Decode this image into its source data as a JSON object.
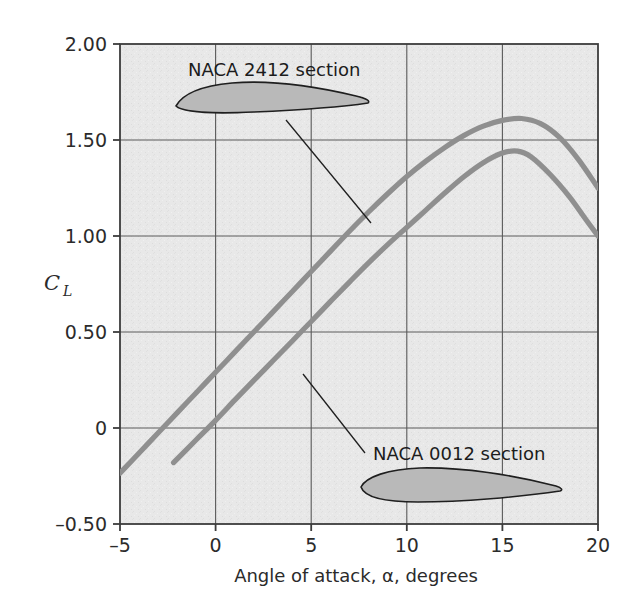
{
  "chart_data": {
    "type": "line",
    "title": "",
    "xlabel": "Angle of attack, α, degrees",
    "ylabel": "C_L",
    "xlim": [
      -5,
      20
    ],
    "ylim": [
      -0.5,
      2.0
    ],
    "xticks": [
      -5,
      0,
      5,
      10,
      15,
      20
    ],
    "xticklabels": [
      "–5",
      "0",
      "5",
      "10",
      "15",
      "20"
    ],
    "yticks": [
      -0.5,
      0,
      0.5,
      1.0,
      1.5,
      2.0
    ],
    "yticklabels": [
      "–0.50",
      "0",
      "0.50",
      "1.00",
      "1.50",
      "2.00"
    ],
    "grid": true,
    "grid_x": [
      0,
      5,
      10,
      15
    ],
    "grid_y": [
      0,
      0.5,
      1.0,
      1.5
    ],
    "legend": "none",
    "plot_bg": "#e6e6e6",
    "curve_color": "#8f8f8f",
    "axis_color": "#4a4a4a",
    "series": [
      {
        "name": "NACA 2412 section",
        "points": [
          [
            -5.0,
            -0.235
          ],
          [
            -4.0,
            -0.13
          ],
          [
            -3.0,
            -0.025
          ],
          [
            -2.0,
            0.08
          ],
          [
            -1.0,
            0.185
          ],
          [
            0.0,
            0.29
          ],
          [
            1.0,
            0.395
          ],
          [
            2.0,
            0.5
          ],
          [
            3.0,
            0.605
          ],
          [
            4.0,
            0.71
          ],
          [
            5.0,
            0.815
          ],
          [
            6.0,
            0.92
          ],
          [
            7.0,
            1.025
          ],
          [
            8.0,
            1.125
          ],
          [
            9.0,
            1.22
          ],
          [
            10.0,
            1.31
          ],
          [
            11.0,
            1.39
          ],
          [
            12.0,
            1.462
          ],
          [
            13.0,
            1.524
          ],
          [
            14.0,
            1.572
          ],
          [
            15.0,
            1.602
          ],
          [
            16.0,
            1.612
          ],
          [
            17.0,
            1.585
          ],
          [
            18.0,
            1.512
          ],
          [
            19.0,
            1.395
          ],
          [
            20.0,
            1.25
          ]
        ]
      },
      {
        "name": "NACA 0012 section",
        "points": [
          [
            -2.2,
            -0.18
          ],
          [
            -1.0,
            -0.06
          ],
          [
            0.0,
            0.04
          ],
          [
            1.0,
            0.145
          ],
          [
            2.0,
            0.248
          ],
          [
            3.0,
            0.35
          ],
          [
            4.0,
            0.452
          ],
          [
            5.0,
            0.555
          ],
          [
            6.0,
            0.658
          ],
          [
            7.0,
            0.76
          ],
          [
            8.0,
            0.86
          ],
          [
            9.0,
            0.955
          ],
          [
            10.0,
            1.045
          ],
          [
            11.0,
            1.135
          ],
          [
            12.0,
            1.225
          ],
          [
            13.0,
            1.31
          ],
          [
            14.0,
            1.382
          ],
          [
            15.0,
            1.432
          ],
          [
            15.8,
            1.442
          ],
          [
            16.5,
            1.412
          ],
          [
            17.5,
            1.32
          ],
          [
            18.5,
            1.205
          ],
          [
            19.3,
            1.095
          ],
          [
            20.0,
            1.0
          ]
        ]
      }
    ],
    "annotations": [
      {
        "text": "NACA 2412 section",
        "airfoil": "naca-2412-airfoil",
        "leader": true
      },
      {
        "text": "NACA 0012 section",
        "airfoil": "naca-0012-airfoil",
        "leader": true
      }
    ]
  }
}
